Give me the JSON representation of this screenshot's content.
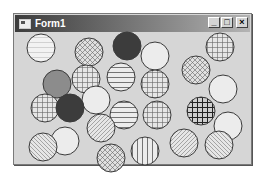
{
  "window": {
    "title": "Form1",
    "controls": {
      "minimize": "_",
      "maximize": "□",
      "close": "×"
    }
  },
  "colors": {
    "client_bg": "#d6d6d6",
    "circle_stroke": "#3a3a3a",
    "dark_fill": "#3c3c3c",
    "gray_fill": "#8c8c8c",
    "empty_fill": "#ececec"
  },
  "circles": [
    {
      "cx": 41,
      "cy": 48,
      "r": 14,
      "pattern": "horizontal-light"
    },
    {
      "cx": 89,
      "cy": 52,
      "r": 14,
      "pattern": "diagcross"
    },
    {
      "cx": 127,
      "cy": 46,
      "r": 14,
      "pattern": "dark-solid"
    },
    {
      "cx": 155,
      "cy": 56,
      "r": 14,
      "pattern": "empty"
    },
    {
      "cx": 220,
      "cy": 47,
      "r": 14,
      "pattern": "cross"
    },
    {
      "cx": 57,
      "cy": 84,
      "r": 14,
      "pattern": "gray-solid"
    },
    {
      "cx": 86,
      "cy": 79,
      "r": 14,
      "pattern": "cross"
    },
    {
      "cx": 121,
      "cy": 77,
      "r": 14,
      "pattern": "horizontal"
    },
    {
      "cx": 196,
      "cy": 70,
      "r": 14,
      "pattern": "diagcross"
    },
    {
      "cx": 155,
      "cy": 84,
      "r": 14,
      "pattern": "cross"
    },
    {
      "cx": 223,
      "cy": 89,
      "r": 14,
      "pattern": "empty"
    },
    {
      "cx": 45,
      "cy": 108,
      "r": 14,
      "pattern": "cross"
    },
    {
      "cx": 96,
      "cy": 100,
      "r": 14,
      "pattern": "empty"
    },
    {
      "cx": 70,
      "cy": 108,
      "r": 14,
      "pattern": "dark-solid"
    },
    {
      "cx": 124,
      "cy": 115,
      "r": 14,
      "pattern": "horizontal"
    },
    {
      "cx": 157,
      "cy": 115,
      "r": 14,
      "pattern": "cross"
    },
    {
      "cx": 201,
      "cy": 111,
      "r": 14,
      "pattern": "cross-bold"
    },
    {
      "cx": 228,
      "cy": 126,
      "r": 14,
      "pattern": "empty"
    },
    {
      "cx": 101,
      "cy": 128,
      "r": 14,
      "pattern": "fdiagonal"
    },
    {
      "cx": 65,
      "cy": 141,
      "r": 14,
      "pattern": "empty"
    },
    {
      "cx": 43,
      "cy": 147,
      "r": 14,
      "pattern": "bdiagonal"
    },
    {
      "cx": 111,
      "cy": 158,
      "r": 14,
      "pattern": "diagcross"
    },
    {
      "cx": 145,
      "cy": 151,
      "r": 14,
      "pattern": "vertical"
    },
    {
      "cx": 184,
      "cy": 143,
      "r": 14,
      "pattern": "fdiagonal"
    },
    {
      "cx": 219,
      "cy": 145,
      "r": 14,
      "pattern": "bdiagonal"
    }
  ]
}
